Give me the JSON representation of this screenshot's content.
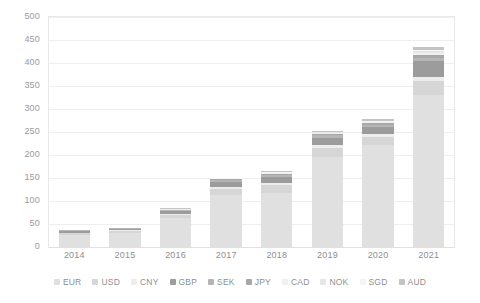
{
  "chart_data": {
    "type": "bar",
    "stacked": true,
    "title": "",
    "subtitle": "",
    "xlabel": "",
    "ylabel": "",
    "categories": [
      "2014",
      "2015",
      "2016",
      "2017",
      "2018",
      "2019",
      "2020",
      "2021"
    ],
    "ylim": [
      0,
      500
    ],
    "ytick_labels": [
      "0",
      "50",
      "100",
      "150",
      "200",
      "250",
      "300",
      "350",
      "400",
      "450",
      "500"
    ],
    "ytick_values": [
      0,
      50,
      100,
      150,
      200,
      250,
      300,
      350,
      400,
      450,
      500
    ],
    "grid": true,
    "legend_position": "bottom",
    "series": [
      {
        "name": "EUR",
        "color": "#e0e0e0",
        "values": [
          26,
          30,
          62,
          112,
          118,
          196,
          222,
          330
        ]
      },
      {
        "name": "USD",
        "color": "#d6d6d6",
        "values": [
          4,
          5,
          8,
          14,
          16,
          20,
          18,
          30
        ]
      },
      {
        "name": "CNY",
        "color": "#ededed",
        "values": [
          1,
          1,
          2,
          4,
          5,
          6,
          6,
          10
        ]
      },
      {
        "name": "GBP",
        "color": "#9c9c9c",
        "values": [
          4,
          4,
          6,
          12,
          14,
          16,
          15,
          34
        ]
      },
      {
        "name": "SEK",
        "color": "#b5b5b5",
        "values": [
          1,
          1,
          2,
          3,
          4,
          5,
          5,
          8
        ]
      },
      {
        "name": "JPY",
        "color": "#a8a8a8",
        "values": [
          0,
          1,
          1,
          2,
          2,
          3,
          3,
          6
        ]
      },
      {
        "name": "CAD",
        "color": "#f0f0f0",
        "values": [
          0,
          0,
          1,
          1,
          2,
          2,
          2,
          4
        ]
      },
      {
        "name": "NOK",
        "color": "#e6e6e6",
        "values": [
          0,
          0,
          1,
          1,
          1,
          2,
          2,
          4
        ]
      },
      {
        "name": "SGD",
        "color": "#f4f4f4",
        "values": [
          0,
          0,
          0,
          1,
          1,
          1,
          2,
          3
        ]
      },
      {
        "name": "AUD",
        "color": "#c4c4c4",
        "values": [
          0,
          0,
          1,
          1,
          2,
          2,
          3,
          6
        ]
      }
    ],
    "totals": [
      36,
      42,
      84,
      151,
      165,
      253,
      278,
      435
    ]
  },
  "legend": {
    "items": [
      {
        "label": "EUR"
      },
      {
        "label": "USD"
      },
      {
        "label": "CNY"
      },
      {
        "label": "GBP"
      },
      {
        "label": "SEK"
      },
      {
        "label": "JPY"
      },
      {
        "label": "CAD"
      },
      {
        "label": "NOK"
      },
      {
        "label": "SGD"
      },
      {
        "label": "AUD"
      }
    ]
  },
  "colors": {
    "grid": "#eeeeee",
    "frame": "#e8e8e8",
    "axis_text": "#9a9a9a",
    "background": "#ffffff"
  }
}
